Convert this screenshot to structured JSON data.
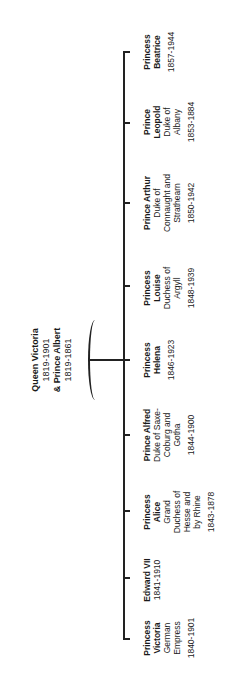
{
  "orientation": "rotated -90deg",
  "parents": {
    "line1": "Queen Victoria",
    "line2": "1819-1901",
    "line3": "& Prince Albert",
    "line4": "1819-1861"
  },
  "children": [
    {
      "name": "Princess Victoria",
      "name1": "Princess",
      "name2": "Victoria",
      "title1": "German",
      "title2": "Empress",
      "title3": "",
      "title4": "",
      "years": "1840-1901"
    },
    {
      "name": "Edward VII",
      "name1": "Edward VII",
      "name2": "",
      "title1": "",
      "title2": "",
      "title3": "",
      "title4": "",
      "years": "1841-1910"
    },
    {
      "name": "Princess Alice",
      "name1": "Princess",
      "name2": "Alice",
      "title1": "Grand",
      "title2": "Duchess of",
      "title3": "Hesse and",
      "title4": "by Rhine",
      "years": "1843-1878"
    },
    {
      "name": "Prince Alfred",
      "name1": "Prince Alfred",
      "name2": "",
      "title1": "Duke of Saxe-",
      "title2": "Coburg and",
      "title3": "Gotha",
      "title4": "",
      "years": "1844-1900"
    },
    {
      "name": "Princess Helena",
      "name1": "Princess",
      "name2": "Helena",
      "title1": "",
      "title2": "",
      "title3": "",
      "title4": "",
      "years": "1846-1923"
    },
    {
      "name": "Princess Louise",
      "name1": "Princess",
      "name2": "Louise",
      "title1": "Duchess of",
      "title2": "Argyll",
      "title3": "",
      "title4": "",
      "years": "1848-1939"
    },
    {
      "name": "Prince Arthur",
      "name1": "Prince Arthur",
      "name2": "",
      "title1": "Duke of",
      "title2": "Connaught and",
      "title3": "Strathearn",
      "title4": "",
      "years": "1850-1942"
    },
    {
      "name": "Prince Leopold",
      "name1": "Prince",
      "name2": "Leopold",
      "title1": "Duke of",
      "title2": "Albany",
      "title3": "",
      "title4": "",
      "years": "1853-1884"
    },
    {
      "name": "Princess Beatrice",
      "name1": "Princess",
      "name2": "Beatrice",
      "title1": "",
      "title2": "",
      "title3": "",
      "title4": "",
      "years": "1857-1944"
    }
  ]
}
